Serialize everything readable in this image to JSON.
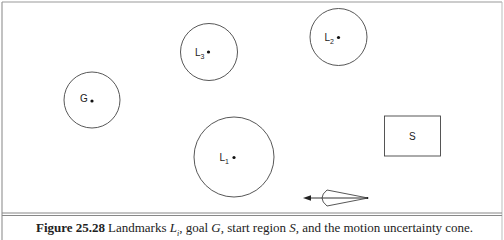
{
  "figure": {
    "number": "Figure 25.28",
    "caption_parts": {
      "prefix": "Landmarks ",
      "landmark_symbol": "L",
      "landmark_subscript": "i",
      "sep1": ", goal ",
      "goal_symbol": "G",
      "sep2": ", start region ",
      "start_symbol": "S",
      "suffix": ", and the motion uncertainty cone."
    }
  },
  "diagram": {
    "goal": {
      "label": "G"
    },
    "landmarks": [
      {
        "label": "L",
        "subscript": "1"
      },
      {
        "label": "L",
        "subscript": "2"
      },
      {
        "label": "L",
        "subscript": "3"
      }
    ],
    "start_region": {
      "label": "S"
    },
    "cone": {
      "description": "motion uncertainty cone",
      "direction": "left"
    },
    "colors": {
      "stroke": "#444444",
      "frame": "#888888",
      "text": "#222222"
    }
  }
}
